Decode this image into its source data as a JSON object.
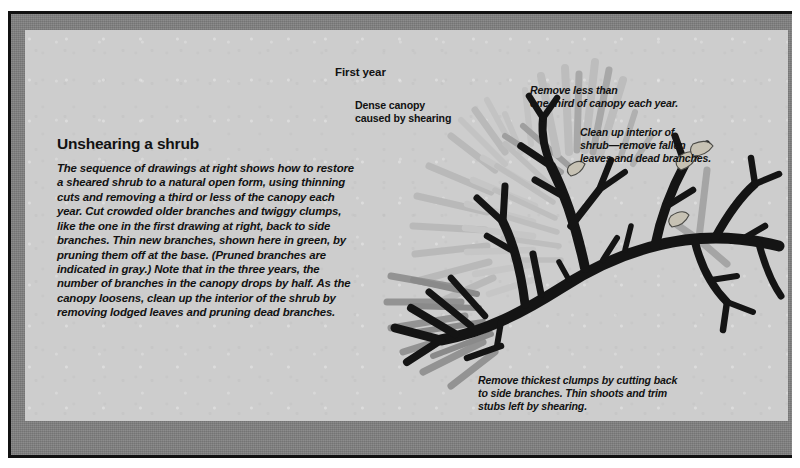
{
  "plate": {
    "frame_color": "#111111",
    "mount_color": "#808080",
    "panel_color": "#cdcdcd"
  },
  "article": {
    "headline": "Unshearing a shrub",
    "intro_lines": [
      "The sequence of drawings at right shows how to restore",
      "a sheared shrub to a natural open form, using thinning",
      "cuts and removing a third or less of the canopy each",
      "year. Cut crowded older branches and twiggy clumps,",
      "like the one in the first drawing at right, back to side",
      "branches. Thin new branches, shown here in green, by",
      "pruning them off at the base. (Pruned branches are",
      "indicated in gray.) Note that in the three years, the",
      "number of branches in the canopy drops by half. As the",
      "canopy loosens, clean up the interior of the shrub by",
      "removing lodged leaves and pruning dead branches."
    ]
  },
  "figure": {
    "stage_label": "First year",
    "callouts": {
      "dense_canopy": [
        "Dense canopy",
        "caused by shearing"
      ],
      "remove_third": [
        "Remove less than",
        "one third of canopy each year."
      ],
      "clean_interior": [
        "Clean up interior of",
        "shrub—remove fallen",
        "leaves and dead branches."
      ],
      "remove_clumps": [
        "Remove thickest clumps by cutting back",
        "to side branches. Thin shoots and trim",
        "stubs left by shearing."
      ]
    },
    "legend": {
      "retained_branch_color": "#141414",
      "pruned_branch_color": "#9c9c9c",
      "pruned_light_color": "#bdbdbd",
      "pruned_mid_color": "#8a8a8a"
    }
  }
}
